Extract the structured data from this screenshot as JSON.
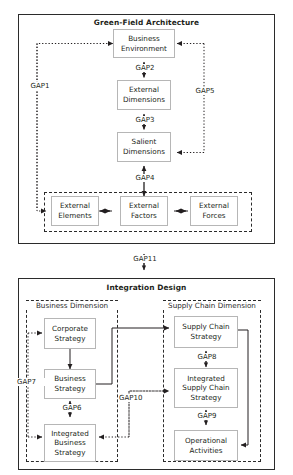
{
  "diagram": {
    "panels": [
      {
        "id": "green-field-architecture",
        "title": "Green-Field Architecture",
        "nodes": [
          {
            "id": "business-environment",
            "label": "Business\nEnvironment"
          },
          {
            "id": "external-dimensions",
            "label": "External\nDimensions"
          },
          {
            "id": "salient-dimensions",
            "label": "Salient\nDimensions"
          },
          {
            "id": "external-elements",
            "label": "External\nElements"
          },
          {
            "id": "external-factors",
            "label": "External\nFactors"
          },
          {
            "id": "external-forces",
            "label": "External\nForces"
          }
        ],
        "groups": [
          {
            "id": "external-group",
            "title": ""
          }
        ]
      },
      {
        "id": "integration-design",
        "title": "Integration Design",
        "groups": [
          {
            "id": "business-dimension",
            "title": "Business Dimension"
          },
          {
            "id": "supply-chain-dimension",
            "title": "Supply Chain Dimension"
          }
        ],
        "nodes": [
          {
            "id": "corporate-strategy",
            "label": "Corporate\nStrategy"
          },
          {
            "id": "business-strategy",
            "label": "Business\nStrategy"
          },
          {
            "id": "integrated-business-strategy",
            "label": "Integrated\nBusiness\nStrategy"
          },
          {
            "id": "supply-chain-strategy",
            "label": "Supply Chain\nStrategy"
          },
          {
            "id": "integrated-supply-chain-strategy",
            "label": "Integrated\nSupply Chain\nStrategy"
          },
          {
            "id": "operational-activities",
            "label": "Operational\nActivities"
          }
        ]
      }
    ],
    "gaps": [
      {
        "id": "gap1",
        "label": "GAP1",
        "style": "dotted"
      },
      {
        "id": "gap2",
        "label": "GAP2",
        "style": "solid"
      },
      {
        "id": "gap3",
        "label": "GAP3",
        "style": "solid"
      },
      {
        "id": "gap4",
        "label": "GAP4",
        "style": "solid"
      },
      {
        "id": "gap5",
        "label": "GAP5",
        "style": "dotted"
      },
      {
        "id": "gap6",
        "label": "GAP6",
        "style": "solid"
      },
      {
        "id": "gap7",
        "label": "GAP7",
        "style": "dotted"
      },
      {
        "id": "gap8",
        "label": "GAP8",
        "style": "solid"
      },
      {
        "id": "gap9",
        "label": "GAP9",
        "style": "solid"
      },
      {
        "id": "gap10",
        "label": "GAP10",
        "style": "dotted"
      },
      {
        "id": "gap11",
        "label": "GAP11",
        "style": "solid"
      }
    ],
    "colors": {
      "frame_stroke": "#2b2b2b",
      "node_stroke": "#b6b6b6",
      "connector": "#231f20",
      "text": "#231f20",
      "background": "#ffffff"
    }
  }
}
